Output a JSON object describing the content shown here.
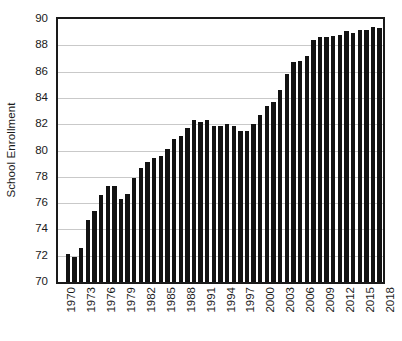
{
  "chart_data": {
    "type": "bar",
    "title": "",
    "subtitle": "",
    "xlabel": "",
    "ylabel": "School Enrollment",
    "ylim": [
      70,
      90
    ],
    "ytick_step": 2,
    "yticks": [
      70,
      72,
      74,
      76,
      78,
      80,
      82,
      84,
      86,
      88,
      90
    ],
    "ytick_labels": [
      "70",
      "72",
      "74",
      "76",
      "78",
      "80",
      "82",
      "84",
      "86",
      "88",
      "90"
    ],
    "grid": true,
    "grid_axis": "y",
    "legend": false,
    "legend_position": "none",
    "bar_color": "#121212",
    "axis_color": "#1a1a1a",
    "gridline_color": "#c9c9c9",
    "background_color": "#ffffff",
    "xtick_rotation": -90,
    "xtick_interval": 3,
    "xtick_labels": [
      "1970",
      "1973",
      "1976",
      "1979",
      "1982",
      "1985",
      "1988",
      "1991",
      "1994",
      "1997",
      "2000",
      "2003",
      "2006",
      "2009",
      "2012",
      "2015",
      "2018"
    ],
    "categories": [
      "1970",
      "1971",
      "1972",
      "1973",
      "1974",
      "1975",
      "1976",
      "1977",
      "1978",
      "1979",
      "1980",
      "1981",
      "1982",
      "1983",
      "1984",
      "1985",
      "1986",
      "1987",
      "1988",
      "1989",
      "1990",
      "1991",
      "1992",
      "1993",
      "1994",
      "1995",
      "1996",
      "1997",
      "1998",
      "1999",
      "2000",
      "2001",
      "2002",
      "2003",
      "2004",
      "2005",
      "2006",
      "2007",
      "2008",
      "2009",
      "2010",
      "2011",
      "2012",
      "2013",
      "2014",
      "2015",
      "2016",
      "2017",
      "2018"
    ],
    "values": [
      null,
      72.1,
      71.9,
      72.6,
      74.7,
      75.4,
      76.6,
      77.3,
      77.3,
      76.3,
      76.7,
      77.9,
      78.7,
      79.1,
      79.4,
      79.6,
      80.1,
      80.9,
      81.1,
      81.7,
      82.3,
      82.2,
      82.3,
      81.9,
      81.9,
      82.0,
      81.9,
      81.5,
      81.5,
      82.0,
      82.7,
      83.4,
      83.7,
      84.6,
      85.8,
      86.7,
      86.8,
      87.2,
      88.4,
      88.6,
      88.6,
      88.7,
      88.8,
      89.1,
      88.9,
      89.2,
      89.2,
      89.4,
      89.3
    ]
  }
}
